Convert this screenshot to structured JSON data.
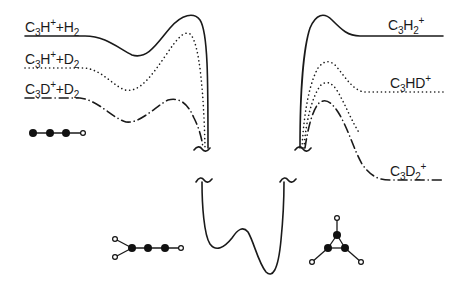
{
  "figure": {
    "type": "potential-energy-diagram",
    "left_channels": [
      {
        "id": "c3h-h2",
        "species": "C",
        "n": "3",
        "atom": "H",
        "charge": "+",
        "partner": "H",
        "partner_n": "2",
        "line_style": "solid"
      },
      {
        "id": "c3h-d2",
        "species": "C",
        "n": "3",
        "atom": "H",
        "charge": "+",
        "partner": "D",
        "partner_n": "2",
        "line_style": "dotted"
      },
      {
        "id": "c3d-d2",
        "species": "C",
        "n": "3",
        "atom": "D",
        "charge": "+",
        "partner": "D",
        "partner_n": "2",
        "line_style": "dash-dot"
      }
    ],
    "right_channels": [
      {
        "id": "c3h2",
        "species": "C",
        "n": "3",
        "rest": "H",
        "rest_n": "2",
        "charge": "+",
        "line_style": "solid"
      },
      {
        "id": "c3hd",
        "species": "C",
        "n": "3",
        "rest": "HD",
        "rest_n": "",
        "charge": "+",
        "line_style": "dotted"
      },
      {
        "id": "c3d2",
        "species": "C",
        "n": "3",
        "rest": "D",
        "rest_n": "2",
        "charge": "+",
        "line_style": "dash-dot"
      }
    ],
    "structures": [
      {
        "name": "linear-C3H+",
        "atoms": "3 carbon (filled) + 1 hydrogen (open), linear chain"
      },
      {
        "name": "linear-H2CCC+",
        "atoms": "3 carbon linear chain with 2 hydrogens on one end carbon"
      },
      {
        "name": "cyclic-C3H2+",
        "atoms": "3 carbon triangle with hydrogens radiating outward"
      }
    ],
    "axis_break_symbol": "~",
    "colors": {
      "ink": "#1a1a1a",
      "background": "#ffffff"
    }
  }
}
